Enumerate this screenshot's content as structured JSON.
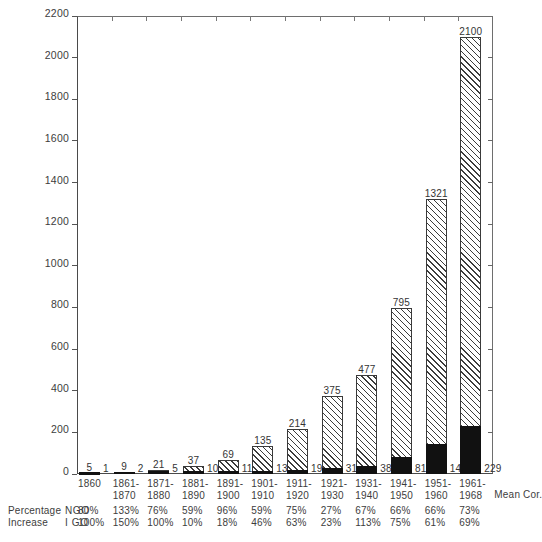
{
  "chart_data": {
    "type": "bar",
    "title": "",
    "subtitle": "",
    "xlabel": "",
    "ylabel": "",
    "ylim": [
      0,
      2200
    ],
    "ytick_step": 200,
    "yticks": [
      0,
      200,
      400,
      600,
      800,
      1000,
      1200,
      1400,
      1600,
      1800,
      2000,
      2200
    ],
    "grid": false,
    "legend_position": "none",
    "stacked": true,
    "categories": [
      "1860",
      "1861-1870",
      "1871-1880",
      "1881-1890",
      "1891-1900",
      "1901-1910",
      "1911-1920",
      "1921-1930",
      "1931-1940",
      "1941-1950",
      "1951-1960",
      "1961-1968"
    ],
    "category_lines": [
      [
        "1860",
        ""
      ],
      [
        "1861-",
        "1870"
      ],
      [
        "1871-",
        "1880"
      ],
      [
        "1881-",
        "1890"
      ],
      [
        "1891-",
        "1900"
      ],
      [
        "1901-",
        "1910"
      ],
      [
        "1911-",
        "1920"
      ],
      [
        "1921-",
        "1930"
      ],
      [
        "1931-",
        "1940"
      ],
      [
        "1941-",
        "1950"
      ],
      [
        "1951-",
        "1960"
      ],
      [
        "1961-",
        "1968"
      ]
    ],
    "series": [
      {
        "name": "NGO",
        "style": "diagonal-hatch",
        "values": [
          5,
          9,
          21,
          37,
          69,
          135,
          214,
          375,
          477,
          795,
          1321,
          2100
        ]
      },
      {
        "name": "IGO",
        "style": "solid-black",
        "values": [
          1,
          2,
          5,
          10,
          11,
          13,
          19,
          31,
          38,
          81,
          142,
          229
        ]
      }
    ],
    "annotations": {
      "mean_cor": "Mean Cor."
    }
  },
  "footer": {
    "row1_label": "Percentage",
    "row2_label": "Increase",
    "key1": "NGO",
    "key2": "I GO",
    "ngo_percent": [
      "80%",
      "133%",
      "76%",
      "59%",
      "96%",
      "59%",
      "75%",
      "27%",
      "67%",
      "66%",
      "66%",
      "73%"
    ],
    "igo_percent": [
      "100%",
      "150%",
      "100%",
      "10%",
      "18%",
      "46%",
      "63%",
      "23%",
      "113%",
      "75%",
      "61%",
      "69%"
    ]
  },
  "colors": {
    "axis": "#4a4a4a",
    "hatch": "#3c3c3c",
    "igo_fill": "#111111",
    "text": "#3d3d3d",
    "background": "#ffffff"
  }
}
